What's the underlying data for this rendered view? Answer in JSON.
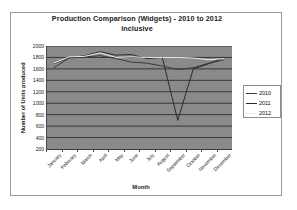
{
  "chart_data": {
    "type": "line",
    "title": "Production Comparison (Widgets) - 2010 to 2012 inclusive",
    "title_line1": "Production Comparison (Widgets) - 2010 to 2012",
    "title_line2": "inclusive",
    "xlabel": "Month",
    "ylabel": "Number of Units produced",
    "categories": [
      "January",
      "February",
      "March",
      "April",
      "May",
      "June",
      "July",
      "August",
      "September",
      "October",
      "November",
      "December"
    ],
    "ylim": [
      200,
      2000
    ],
    "yticks": [
      2000,
      1800,
      1600,
      1400,
      1200,
      1000,
      800,
      600,
      400,
      200
    ],
    "grid": true,
    "legend_position": "right",
    "plot_background": "#8a8a8a",
    "series": [
      {
        "name": "2010",
        "color": "#3b3b3b",
        "values": [
          1620,
          1790,
          1810,
          1830,
          1780,
          1720,
          1700,
          1650,
          1590,
          1620,
          1700,
          1760
        ]
      },
      {
        "name": "2011",
        "color": "#2a2a2a",
        "values": [
          1690,
          1800,
          1830,
          1900,
          1840,
          1850,
          1780,
          1800,
          700,
          1600,
          1690,
          1800
        ]
      },
      {
        "name": "2012",
        "color": "#ededed",
        "values": [
          1700,
          1810,
          1820,
          1880,
          1800,
          1810,
          1800,
          1800,
          1800,
          1790,
          1760,
          1780
        ]
      }
    ]
  },
  "legend": {
    "entries": [
      {
        "label": "2010",
        "swatch": "line"
      },
      {
        "label": "2011",
        "swatch": "line"
      },
      {
        "label": "2012",
        "swatch": "line-light"
      }
    ]
  }
}
